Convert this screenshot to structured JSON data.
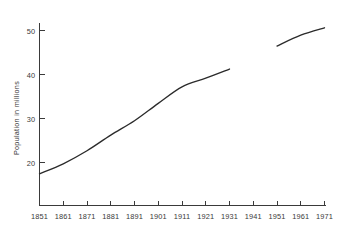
{
  "chart_data": {
    "type": "line",
    "title": "",
    "xlabel": "",
    "ylabel": "Population  in  millions",
    "xlim": [
      1851,
      1971
    ],
    "ylim": [
      13.5,
      55.5
    ],
    "grid": false,
    "legend": null,
    "x_ticks": [
      1851,
      1861,
      1871,
      1881,
      1891,
      1901,
      1911,
      1921,
      1931,
      1941,
      1951,
      1961,
      1971
    ],
    "x_tick_labels": [
      "1851",
      "1861",
      "1871",
      "1881",
      "1891",
      "1901",
      "1911",
      "1921",
      "1931",
      "1941",
      "1951",
      "1961",
      "1971"
    ],
    "y_ticks": [
      20,
      30,
      40,
      50
    ],
    "y_tick_labels": [
      "20",
      "30",
      "40",
      "50"
    ],
    "series": [
      {
        "name": "Population",
        "note": "census series, break at 1941 (no census taken)",
        "x": [
          1851,
          1861,
          1871,
          1881,
          1891,
          1901,
          1911,
          1921,
          1931
        ],
        "values": [
          20.8,
          23.1,
          26.1,
          29.7,
          33.0,
          37.0,
          40.8,
          42.8,
          44.9
        ]
      },
      {
        "name": "Population (post-war)",
        "note": "resumes 1951",
        "x": [
          1951,
          1961,
          1971
        ],
        "values": [
          50.2,
          52.7,
          54.4
        ]
      }
    ]
  },
  "axis": {
    "ylabel_text": "Population  in  millions"
  }
}
